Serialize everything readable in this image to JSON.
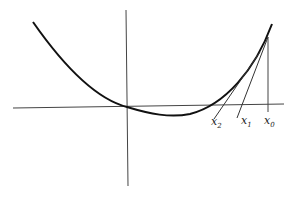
{
  "diagram": {
    "title": "",
    "colors": {
      "curve": "#111111",
      "axes": "#444444",
      "tangents": "#333333",
      "background": "#ffffff"
    },
    "labels": {
      "x0": {
        "base": "x",
        "sub": "0"
      },
      "x1": {
        "base": "x",
        "sub": "1"
      },
      "x2": {
        "base": "x",
        "sub": "2"
      }
    }
  }
}
